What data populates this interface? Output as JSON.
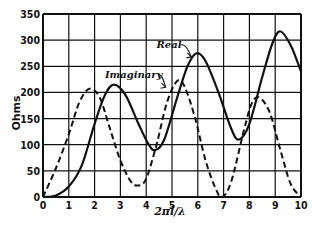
{
  "chart_data": {
    "type": "line",
    "title": "",
    "xlabel": "2πl/λ",
    "ylabel": "Ohms",
    "xlim": [
      0,
      10
    ],
    "ylim": [
      0,
      350
    ],
    "grid": true,
    "legend": "inline annotations",
    "x_ticks": [
      "0",
      "1",
      "2",
      "3",
      "4",
      "5",
      "6",
      "7",
      "8",
      "9",
      "10"
    ],
    "y_ticks": [
      "0",
      "50",
      "100",
      "150",
      "200",
      "250",
      "300",
      "350"
    ],
    "series": [
      {
        "name": "Real",
        "style": "solid",
        "points": [
          [
            0,
            0
          ],
          [
            0.5,
            3
          ],
          [
            1,
            20
          ],
          [
            1.5,
            60
          ],
          [
            2,
            140
          ],
          [
            2.4,
            195
          ],
          [
            2.75,
            215
          ],
          [
            3.2,
            195
          ],
          [
            3.7,
            140
          ],
          [
            4.1,
            100
          ],
          [
            4.35,
            90
          ],
          [
            4.7,
            110
          ],
          [
            5.2,
            190
          ],
          [
            5.6,
            250
          ],
          [
            5.95,
            275
          ],
          [
            6.3,
            260
          ],
          [
            6.8,
            200
          ],
          [
            7.3,
            130
          ],
          [
            7.6,
            110
          ],
          [
            8,
            140
          ],
          [
            8.5,
            230
          ],
          [
            8.9,
            295
          ],
          [
            9.2,
            317
          ],
          [
            9.6,
            290
          ],
          [
            10,
            240
          ]
        ]
      },
      {
        "name": "Imaginary",
        "style": "dashed",
        "points": [
          [
            0,
            0
          ],
          [
            0.5,
            55
          ],
          [
            1,
            120
          ],
          [
            1.4,
            180
          ],
          [
            1.8,
            207
          ],
          [
            2.2,
            190
          ],
          [
            2.6,
            130
          ],
          [
            3,
            70
          ],
          [
            3.4,
            30
          ],
          [
            3.7,
            22
          ],
          [
            4,
            35
          ],
          [
            4.4,
            100
          ],
          [
            4.8,
            180
          ],
          [
            5.2,
            222
          ],
          [
            5.5,
            210
          ],
          [
            5.9,
            150
          ],
          [
            6.3,
            70
          ],
          [
            6.7,
            15
          ],
          [
            6.95,
            0
          ],
          [
            7.3,
            30
          ],
          [
            7.8,
            130
          ],
          [
            8.1,
            180
          ],
          [
            8.4,
            190
          ],
          [
            8.8,
            160
          ],
          [
            9.2,
            90
          ],
          [
            9.6,
            25
          ],
          [
            10,
            0
          ]
        ]
      }
    ],
    "annotations": [
      {
        "text": "Real",
        "x": 4.4,
        "y": 285,
        "arrow_to": [
          5.75,
          268
        ]
      },
      {
        "text": "Imaginary",
        "x": 2.4,
        "y": 228,
        "arrow_to": [
          4.75,
          210
        ]
      }
    ]
  },
  "layout": {
    "plot_left": 43,
    "plot_right": 301,
    "plot_top": 14,
    "plot_bottom": 197
  }
}
